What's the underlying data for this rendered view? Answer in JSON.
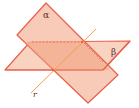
{
  "figure": {
    "labels": {
      "alpha": "α",
      "beta": "β",
      "line": "r"
    },
    "colors": {
      "plane_fill": "#f8c9b4",
      "plane_overlap": "#f2a98a",
      "plane_edge": "#e8604a",
      "line_r": "#f0a050",
      "dashed_edge": "#e8705a"
    }
  }
}
